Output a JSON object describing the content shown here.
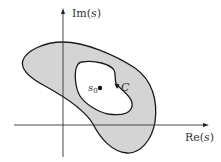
{
  "diagram": {
    "type": "complex-plane-region",
    "axes": {
      "vertical_label_prefix": "Im(",
      "vertical_label_var": "s",
      "vertical_label_suffix": ")",
      "horizontal_label_prefix": "Re(",
      "horizontal_label_var": "s",
      "horizontal_label_suffix": ")"
    },
    "point": {
      "label_base": "s",
      "label_sub": "0"
    },
    "contour": {
      "label": "C",
      "direction": "clockwise-arrow-downward"
    },
    "colors": {
      "region_fill": "#d4d4d4",
      "stroke": "#1a1a1a",
      "background": "#ffffff"
    }
  }
}
